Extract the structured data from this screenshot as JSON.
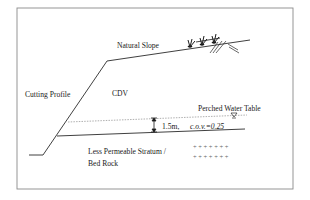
{
  "figure": {
    "labels": {
      "natural_slope": "Natural Slope",
      "cutting_profile": "Cutting Profile",
      "cdv": "CDV",
      "perched_water_table": "Perched Water Table",
      "thickness": "1.5m,",
      "cov": "c.o.v.=0.25",
      "stratum_line1": "Less Permeable Stratum /",
      "stratum_line2": "Bed Rock",
      "rock_symbols_row1": "+ + + + + + +",
      "rock_symbols_row2": "+ + + + + + +"
    },
    "icons": {
      "vegetation": "grass-tufts-icon",
      "ground_hatch": "ground-hatch-icon",
      "water_table_marker": "inverted-triangle-icon",
      "dimension_arrows": "double-arrow-icon"
    },
    "colors": {
      "line": "#2a2a2a",
      "frame": "#8a8a8a",
      "dashed": "#9a9a9a",
      "background": "#ffffff"
    }
  }
}
